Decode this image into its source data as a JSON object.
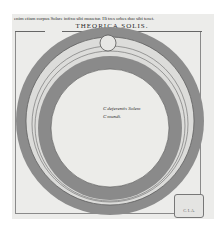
{
  "page": {
    "header_text": "enim etiam corpus Solare infixū sibi mouetur. Hi tres orbes duo sibi tenēt.",
    "title": "THEORICA SOLIS.",
    "diagram": {
      "labels": [
        {
          "marker": "C",
          "text": "deferentis Solem"
        },
        {
          "marker": "C",
          "text": "mundi."
        }
      ],
      "colors": {
        "paper": "#ececea",
        "ring_dark": "#8a8a8a",
        "ring_light": "#d6d6d4",
        "line": "#555555"
      }
    },
    "stamp": {
      "text": "C. I. A."
    }
  }
}
